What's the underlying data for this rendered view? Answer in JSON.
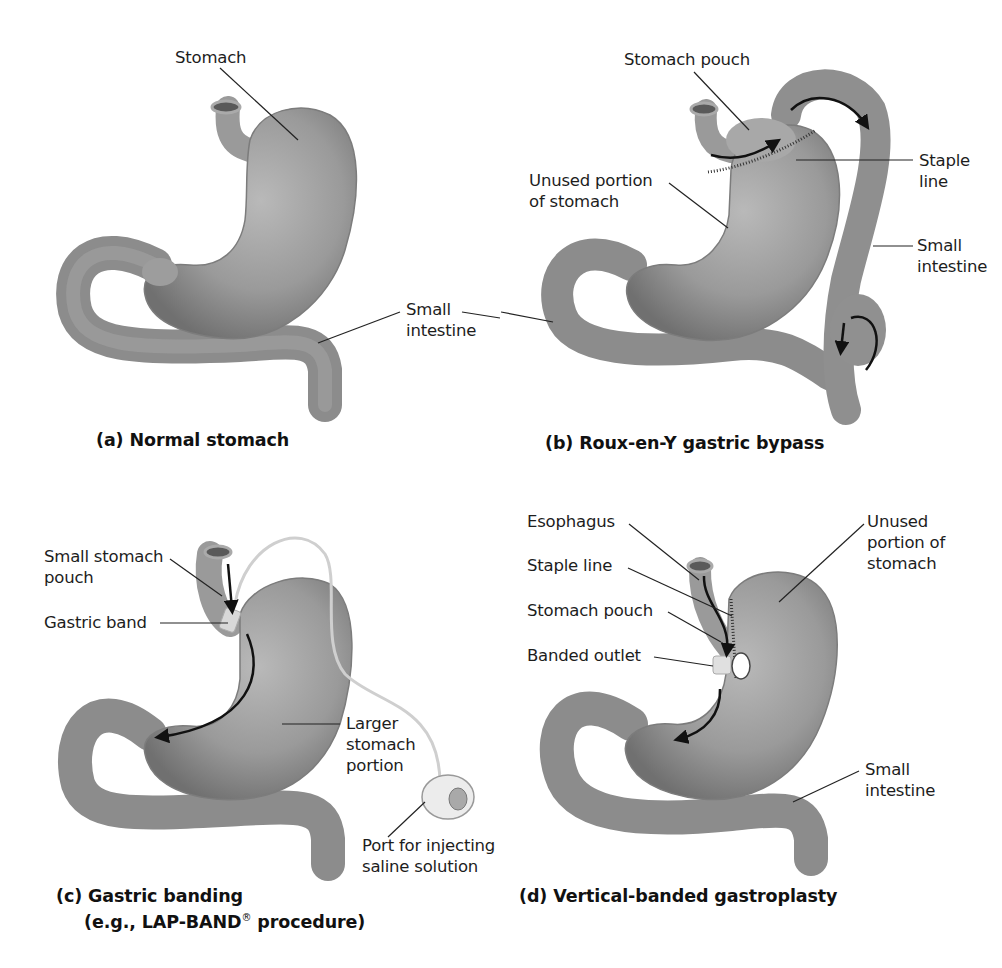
{
  "figure": {
    "panels": [
      {
        "id": "a",
        "caption": "(a) Normal stomach",
        "labels": {
          "stomach": "Stomach",
          "small_intestine_1": "Small",
          "small_intestine_2": "intestine"
        }
      },
      {
        "id": "b",
        "caption": "(b) Roux-en-Y gastric bypass",
        "labels": {
          "stomach_pouch": "Stomach pouch",
          "unused_1": "Unused portion",
          "unused_2": "of stomach",
          "staple_1": "Staple",
          "staple_2": "line",
          "small_intestine_1": "Small",
          "small_intestine_2": "intestine"
        }
      },
      {
        "id": "c",
        "caption_line1": "(c) Gastric banding",
        "caption_line2_pre": "(e.g., LAP-BAND",
        "caption_reg": "®",
        "caption_line2_post": " procedure)",
        "labels": {
          "pouch_1": "Small stomach",
          "pouch_2": "pouch",
          "band": "Gastric band",
          "larger_1": "Larger",
          "larger_2": "stomach",
          "larger_3": "portion",
          "port_1": "Port for injecting",
          "port_2": "saline solution"
        }
      },
      {
        "id": "d",
        "caption": "(d) Vertical-banded gastroplasty",
        "labels": {
          "esophagus": "Esophagus",
          "staple_line": "Staple line",
          "stomach_pouch": "Stomach pouch",
          "banded_outlet": "Banded outlet",
          "unused_1": "Unused",
          "unused_2": "portion of",
          "unused_3": "stomach",
          "small_intestine_1": "Small",
          "small_intestine_2": "intestine"
        }
      }
    ],
    "colors": {
      "organ_fill": "#8f8f8f",
      "organ_shade": "#6e6e6e",
      "organ_highlight": "#b4b4b4",
      "leader_line": "#222222",
      "text": "#1d1d1d"
    }
  }
}
